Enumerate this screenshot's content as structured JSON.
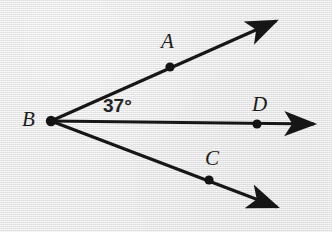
{
  "figure": {
    "kind": "geometry-diagram",
    "background_color": "#e8e8e8",
    "ink_color": "#161616",
    "width": 332,
    "height": 232
  },
  "vertex": {
    "id": "B",
    "label": "B",
    "label_x": 22,
    "label_y": 109,
    "x": 51,
    "y": 121,
    "dot_radius": 5.2
  },
  "angle": {
    "value": "37°",
    "degrees": 37,
    "between": "BA and BD",
    "label_x": 103,
    "label_y": 96,
    "color": "#232323"
  },
  "rays": [
    {
      "id": "ray-BA",
      "name": "upper-ray",
      "from_x": 51,
      "from_y": 121,
      "to_x": 276,
      "to_y": 21,
      "point": {
        "id": "A",
        "label": "A",
        "x": 170,
        "y": 67,
        "dot_radius": 4.6,
        "label_x": 161,
        "label_y": 31
      }
    },
    {
      "id": "ray-BD",
      "name": "middle-ray",
      "from_x": 51,
      "from_y": 121,
      "to_x": 314,
      "to_y": 124,
      "point": {
        "id": "D",
        "label": "D",
        "x": 257,
        "y": 124,
        "dot_radius": 4.6,
        "label_x": 252,
        "label_y": 94
      }
    },
    {
      "id": "ray-BC",
      "name": "lower-ray",
      "from_x": 51,
      "from_y": 121,
      "to_x": 277,
      "to_y": 207,
      "point": {
        "id": "C",
        "label": "C",
        "x": 209,
        "y": 180,
        "dot_radius": 4.6,
        "label_x": 205,
        "label_y": 148
      }
    }
  ]
}
